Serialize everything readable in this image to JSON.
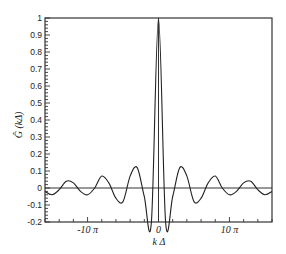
{
  "chart_data": {
    "type": "line",
    "title": "",
    "xlabel": "k Δ",
    "ylabel": "Ĝ (kΔ)",
    "xlim_pi": [
      -16,
      16
    ],
    "ylim": [
      -0.2,
      1.0
    ],
    "grid": false,
    "legend": null,
    "x_ticks": [
      {
        "value_pi": -10,
        "label": "-10 π"
      },
      {
        "value_pi": 0,
        "label": "0"
      },
      {
        "value_pi": 10,
        "label": "10 π"
      }
    ],
    "y_ticks": [
      {
        "value": 1,
        "label": "1"
      },
      {
        "value": 0.9,
        "label": "0.9"
      },
      {
        "value": 0.8,
        "label": "0.8"
      },
      {
        "value": 0.7,
        "label": "0.7"
      },
      {
        "value": 0.6,
        "label": "0.6"
      },
      {
        "value": 0.5,
        "label": "0.5"
      },
      {
        "value": 0.4,
        "label": "0.4"
      },
      {
        "value": 0.3,
        "label": "0.3"
      },
      {
        "value": 0.2,
        "label": "0.2"
      },
      {
        "value": 0.1,
        "label": "0.1"
      },
      {
        "value": 0,
        "label": "0"
      },
      {
        "value": -0.1,
        "label": "-0.1"
      },
      {
        "value": -0.2,
        "label": "-0.2"
      }
    ],
    "reference_lines": {
      "horizontal_y": 0,
      "vertical_x": 0
    },
    "series": [
      {
        "name": "G_hat",
        "x_pi": [
          -16,
          -15,
          -14,
          -13,
          -12,
          -11,
          -10,
          -9,
          -8,
          -7,
          -6,
          -5,
          -4,
          -3,
          -2,
          -1,
          0,
          1,
          2,
          3,
          4,
          5,
          6,
          7,
          8,
          9,
          10,
          11,
          12,
          13,
          14,
          15,
          16
        ],
        "values": [
          -0.02,
          -0.04,
          -0.01,
          0.04,
          0.03,
          -0.02,
          -0.04,
          0.0,
          0.07,
          0.03,
          -0.06,
          -0.08,
          0.07,
          0.12,
          -0.05,
          -0.2,
          1.0,
          -0.2,
          -0.05,
          0.12,
          0.07,
          -0.08,
          -0.06,
          0.03,
          0.07,
          0.0,
          -0.04,
          -0.02,
          0.03,
          0.04,
          -0.01,
          -0.04,
          -0.02
        ]
      }
    ]
  }
}
